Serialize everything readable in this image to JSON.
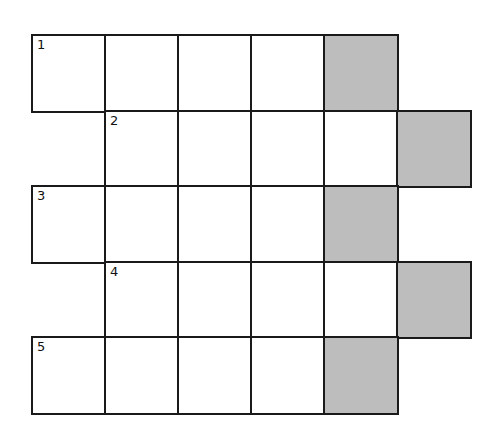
{
  "puzzle": {
    "type": "crossword-grid",
    "colors": {
      "line": "#1a1a1a",
      "shaded": "#bdbdbd",
      "background": "#ffffff"
    },
    "grid": {
      "origin_x": 32,
      "origin_y": 35,
      "col_width": 73,
      "row_height": 75.6,
      "rows": [
        {
          "row": 1,
          "start_col": 0,
          "cells": 5,
          "shaded_cols": [
            4
          ],
          "clue_number": "1",
          "number_col": 0
        },
        {
          "row": 2,
          "start_col": 1,
          "cells": 5,
          "shaded_cols": [
            5
          ],
          "clue_number": "2",
          "number_col": 1
        },
        {
          "row": 3,
          "start_col": 0,
          "cells": 5,
          "shaded_cols": [
            4
          ],
          "clue_number": "3",
          "number_col": 0
        },
        {
          "row": 4,
          "start_col": 1,
          "cells": 5,
          "shaded_cols": [
            5
          ],
          "clue_number": "4",
          "number_col": 1
        },
        {
          "row": 5,
          "start_col": 0,
          "cells": 5,
          "shaded_cols": [
            4
          ],
          "clue_number": "5",
          "number_col": 0
        }
      ]
    }
  }
}
